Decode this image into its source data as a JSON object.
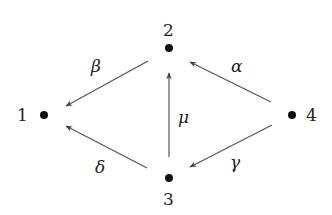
{
  "diagram": {
    "type": "directed-graph",
    "colors": {
      "node": "#111111",
      "edge": "#555555",
      "text": "#222222",
      "background": "#ffffff"
    },
    "nodes": [
      {
        "id": "1",
        "label": "1",
        "x": 44,
        "y": 115
      },
      {
        "id": "2",
        "label": "2",
        "x": 169,
        "y": 48
      },
      {
        "id": "3",
        "label": "3",
        "x": 169,
        "y": 178
      },
      {
        "id": "4",
        "label": "4",
        "x": 292,
        "y": 115
      }
    ],
    "edges": [
      {
        "id": "alpha",
        "label": "α",
        "from": "4",
        "to": "2"
      },
      {
        "id": "beta",
        "label": "β",
        "from": "2",
        "to": "1"
      },
      {
        "id": "gamma",
        "label": "γ",
        "from": "4",
        "to": "3"
      },
      {
        "id": "delta",
        "label": "δ",
        "from": "3",
        "to": "1"
      },
      {
        "id": "mu",
        "label": "μ",
        "from": "3",
        "to": "2"
      }
    ]
  }
}
